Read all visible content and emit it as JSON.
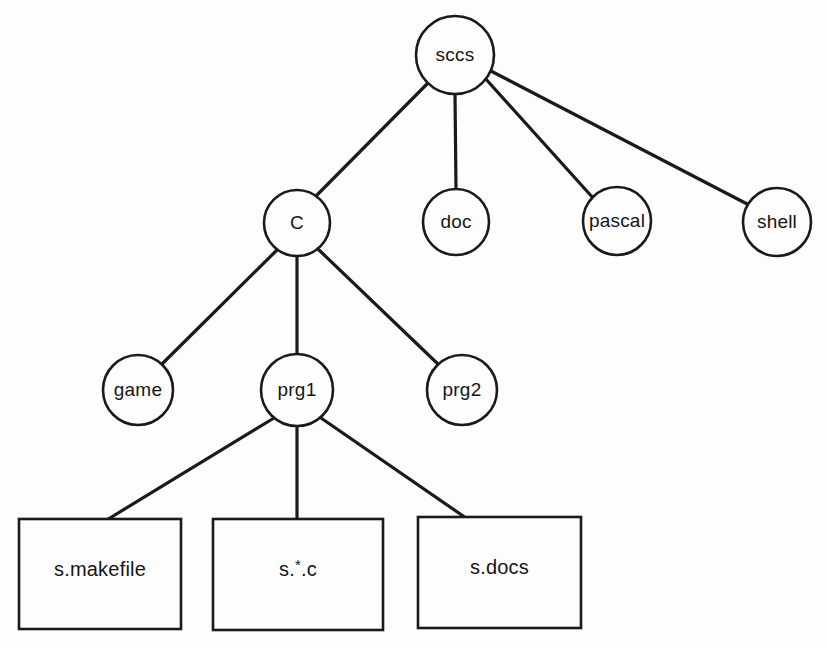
{
  "diagram": {
    "type": "tree",
    "background_color": "#fdfdfd",
    "stroke_color": "#1a1a1a",
    "text_color": "#151515",
    "nodes": [
      {
        "id": "sccs",
        "label": "sccs",
        "shape": "circle",
        "cx": 455,
        "cy": 55,
        "r": 39,
        "level": 0
      },
      {
        "id": "c",
        "label": "C",
        "shape": "circle",
        "cx": 297,
        "cy": 223,
        "r": 33,
        "level": 1
      },
      {
        "id": "doc",
        "label": "doc",
        "shape": "circle",
        "cx": 456,
        "cy": 222,
        "r": 33,
        "level": 1
      },
      {
        "id": "pascal",
        "label": "pascal",
        "shape": "circle",
        "cx": 617,
        "cy": 221,
        "r": 34,
        "level": 1
      },
      {
        "id": "shell",
        "label": "shell",
        "shape": "circle",
        "cx": 777,
        "cy": 222,
        "r": 34,
        "level": 1
      },
      {
        "id": "game",
        "label": "game",
        "shape": "circle",
        "cx": 138,
        "cy": 390,
        "r": 35,
        "level": 2
      },
      {
        "id": "prg1",
        "label": "prg1",
        "shape": "circle",
        "cx": 297,
        "cy": 390,
        "r": 36,
        "level": 2
      },
      {
        "id": "prg2",
        "label": "prg2",
        "shape": "circle",
        "cx": 462,
        "cy": 390,
        "r": 35,
        "level": 2
      },
      {
        "id": "s_makefile",
        "label": "s.makefile",
        "shape": "rect",
        "x": 19,
        "y": 519,
        "w": 162,
        "h": 110,
        "level": 3
      },
      {
        "id": "s_star_c",
        "label": "s.*.c",
        "shape": "rect",
        "x": 213,
        "y": 519,
        "w": 170,
        "h": 111,
        "level": 3
      },
      {
        "id": "s_docs",
        "label": "s.docs",
        "shape": "rect",
        "x": 418,
        "y": 517,
        "w": 163,
        "h": 111,
        "level": 3
      }
    ],
    "edges": [
      {
        "id": "sccs-c",
        "from": "sccs",
        "to": "c",
        "x1": 428,
        "y1": 83,
        "x2": 316,
        "y2": 196
      },
      {
        "id": "sccs-doc",
        "from": "sccs",
        "to": "doc",
        "x1": 455,
        "y1": 94,
        "x2": 456,
        "y2": 189
      },
      {
        "id": "sccs-pascal",
        "from": "sccs",
        "to": "pascal",
        "x1": 484,
        "y1": 77,
        "x2": 594,
        "y2": 199
      },
      {
        "id": "sccs-shell",
        "from": "sccs",
        "to": "shell",
        "x1": 489,
        "y1": 70,
        "x2": 751,
        "y2": 206
      },
      {
        "id": "c-game",
        "from": "c",
        "to": "game",
        "x1": 277,
        "y1": 250,
        "x2": 160,
        "y2": 366
      },
      {
        "id": "c-prg1",
        "from": "c",
        "to": "prg1",
        "x1": 297,
        "y1": 256,
        "x2": 297,
        "y2": 354
      },
      {
        "id": "c-prg2",
        "from": "c",
        "to": "prg2",
        "x1": 319,
        "y1": 250,
        "x2": 440,
        "y2": 366
      },
      {
        "id": "prg1-s_makefile",
        "from": "prg1",
        "to": "s_makefile",
        "x1": 274,
        "y1": 418,
        "x2": 105,
        "y2": 521
      },
      {
        "id": "prg1-s_star_c",
        "from": "prg1",
        "to": "s_star_c",
        "x1": 297,
        "y1": 426,
        "x2": 297,
        "y2": 519
      },
      {
        "id": "prg1-s_docs",
        "from": "prg1",
        "to": "s_docs",
        "x1": 321,
        "y1": 418,
        "x2": 466,
        "y2": 518
      }
    ]
  }
}
